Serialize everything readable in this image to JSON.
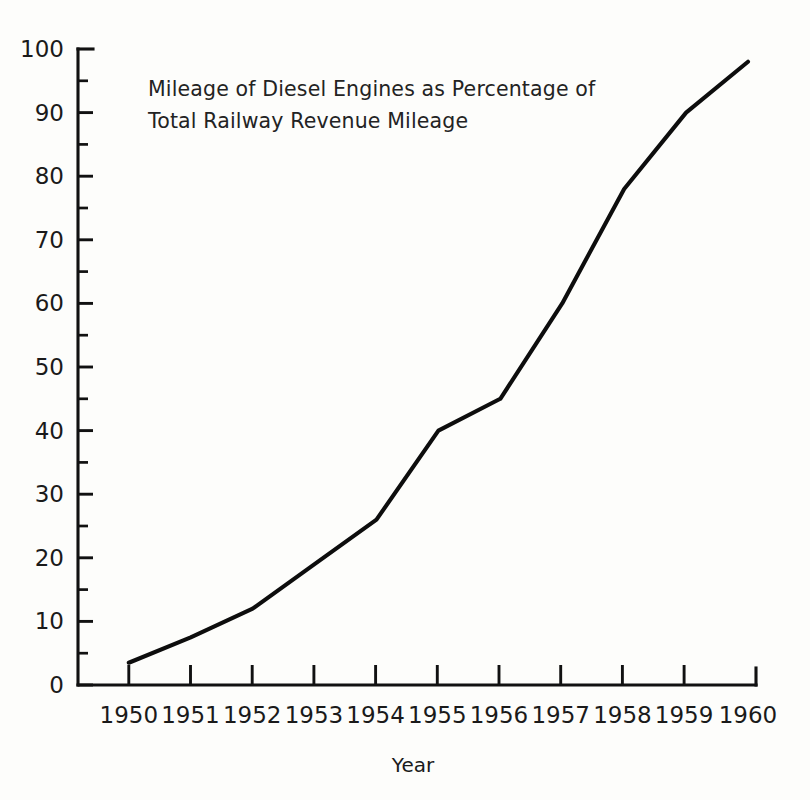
{
  "chart_data": {
    "type": "line",
    "title": "Mileage of Diesel Engines as Percentage of Total Railway Revenue Mileage",
    "title_line1": "Mileage of Diesel Engines as Percentage of",
    "title_line2": "Total Railway Revenue Mileage",
    "xlabel": "Year",
    "ylabel": "",
    "categories": [
      "1950",
      "1951",
      "1952",
      "1953",
      "1954",
      "1955",
      "1956",
      "1957",
      "1958",
      "1959",
      "1960"
    ],
    "x": [
      1950,
      1951,
      1952,
      1953,
      1954,
      1955,
      1956,
      1957,
      1958,
      1959,
      1960
    ],
    "values": [
      3.5,
      7.5,
      12,
      19,
      26,
      40,
      45,
      60,
      78,
      90,
      98
    ],
    "xlim": [
      1950,
      1960
    ],
    "ylim": [
      0,
      100
    ],
    "y_ticks_major": [
      0,
      10,
      20,
      30,
      40,
      50,
      60,
      70,
      80,
      90,
      100
    ],
    "y_tick_labels": [
      "0",
      "10",
      "20",
      "30",
      "40",
      "50",
      "60",
      "70",
      "80",
      "90",
      "100"
    ],
    "y_ticks_minor": [
      5,
      15,
      25,
      35,
      45,
      55,
      65,
      75,
      85,
      95
    ],
    "grid": false,
    "legend": false,
    "series": [
      {
        "name": "Mileage of Diesel Engines as Percentage of Total Railway Revenue Mileage",
        "values": [
          3.5,
          7.5,
          12,
          19,
          26,
          40,
          45,
          60,
          78,
          90,
          98
        ]
      }
    ],
    "colors": {
      "line": "#0d0d0d",
      "axis": "#111111",
      "text": "#1a1a1a",
      "background": "#fdfdfb"
    }
  }
}
